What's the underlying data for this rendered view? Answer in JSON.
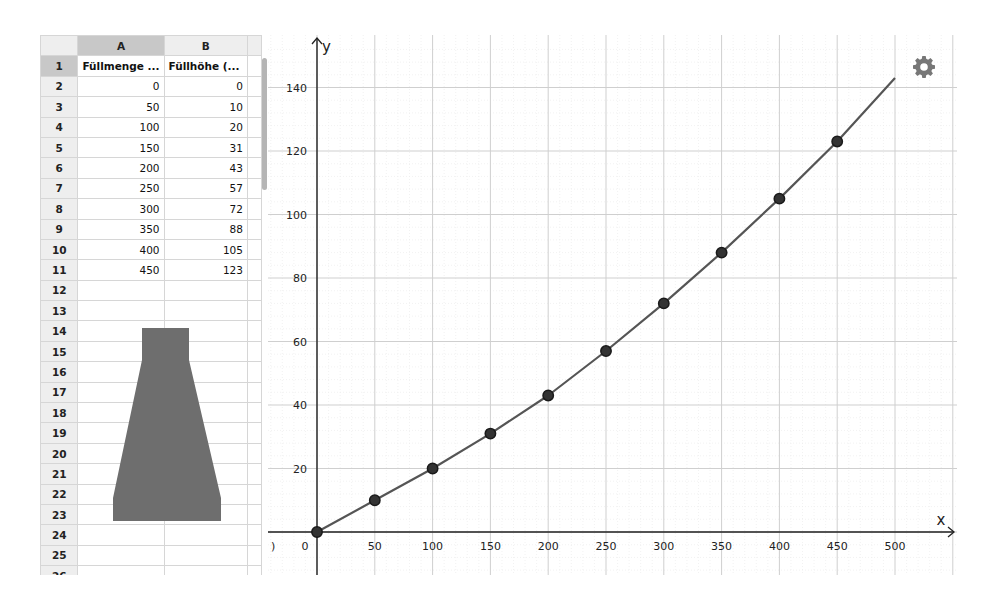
{
  "spreadsheet": {
    "columns": [
      "A",
      "B"
    ],
    "selected_column": "A",
    "selected_row": "1",
    "header_row": {
      "row": "1",
      "a": "Füllmenge ...",
      "b": "Füllhöhe (..."
    },
    "rows": [
      {
        "row": "2",
        "a": "0",
        "b": "0"
      },
      {
        "row": "3",
        "a": "50",
        "b": "10"
      },
      {
        "row": "4",
        "a": "100",
        "b": "20"
      },
      {
        "row": "5",
        "a": "150",
        "b": "31"
      },
      {
        "row": "6",
        "a": "200",
        "b": "43"
      },
      {
        "row": "7",
        "a": "250",
        "b": "57"
      },
      {
        "row": "8",
        "a": "300",
        "b": "72"
      },
      {
        "row": "9",
        "a": "350",
        "b": "88"
      },
      {
        "row": "10",
        "a": "400",
        "b": "105"
      },
      {
        "row": "11",
        "a": "450",
        "b": "123"
      },
      {
        "row": "12",
        "a": "",
        "b": ""
      },
      {
        "row": "13",
        "a": "",
        "b": ""
      },
      {
        "row": "14",
        "a": "",
        "b": ""
      },
      {
        "row": "15",
        "a": "",
        "b": ""
      },
      {
        "row": "16",
        "a": "",
        "b": ""
      },
      {
        "row": "17",
        "a": "",
        "b": ""
      },
      {
        "row": "18",
        "a": "",
        "b": ""
      },
      {
        "row": "19",
        "a": "",
        "b": ""
      },
      {
        "row": "20",
        "a": "",
        "b": ""
      },
      {
        "row": "21",
        "a": "",
        "b": ""
      },
      {
        "row": "22",
        "a": "",
        "b": ""
      },
      {
        "row": "23",
        "a": "",
        "b": ""
      },
      {
        "row": "24",
        "a": "",
        "b": ""
      },
      {
        "row": "25",
        "a": "",
        "b": ""
      },
      {
        "row": "26",
        "a": "",
        "b": ""
      }
    ],
    "flask_image": "flask-silhouette",
    "flask_color": "#6e6e6e"
  },
  "graph": {
    "settings_icon": "gear-icon",
    "curve_color": "#555555",
    "point_color": "#1a1a1a",
    "grid_major_color": "#cfcfcf",
    "grid_minor_color": "#ececec"
  },
  "chart_data": {
    "type": "scatter",
    "title": "",
    "xlabel": "x",
    "ylabel": "y",
    "x_ticks": [
      0,
      50,
      100,
      150,
      200,
      250,
      300,
      350,
      400,
      450,
      500
    ],
    "y_ticks": [
      20,
      40,
      60,
      80,
      100,
      120,
      140
    ],
    "xlim": [
      -70,
      550
    ],
    "ylim": [
      -14,
      155
    ],
    "grid": true,
    "series": [
      {
        "name": "Füllhöhe",
        "type": "scatter",
        "x": [
          0,
          50,
          100,
          150,
          200,
          250,
          300,
          350,
          400,
          450
        ],
        "y": [
          0,
          10,
          20,
          31,
          43,
          57,
          72,
          88,
          105,
          123
        ]
      },
      {
        "name": "fit-curve",
        "type": "line",
        "x": [
          0,
          50,
          100,
          150,
          200,
          250,
          300,
          350,
          400,
          450,
          500
        ],
        "y": [
          0,
          10,
          20,
          31,
          43,
          57,
          72,
          88,
          105,
          123,
          143
        ]
      }
    ]
  }
}
